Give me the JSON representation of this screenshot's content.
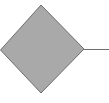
{
  "diagram": {
    "shapes": [
      {
        "type": "diamond",
        "label": "",
        "fill": "#a9a9a9",
        "stroke": "#6e6e6e",
        "points": {
          "left": [
            0,
            50
          ],
          "top": [
            41,
            5
          ],
          "right": [
            84,
            49
          ],
          "bottom": [
            41,
            93
          ]
        }
      }
    ],
    "connectors": [
      {
        "from": [
          84,
          49
        ],
        "to": [
          109,
          49
        ],
        "stroke": "#6e6e6e"
      }
    ]
  }
}
